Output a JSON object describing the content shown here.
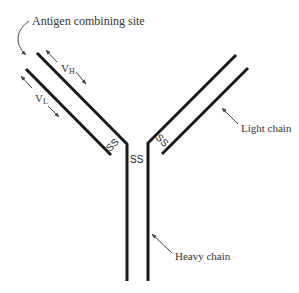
{
  "diagram": {
    "type": "antibody-structure",
    "colors": {
      "chain_stroke": "#1a1a1a",
      "annotation_stroke": "#444444",
      "text": "#333333",
      "background": "#ffffff"
    },
    "labels": {
      "antigen_site": "Antigen combining site",
      "vh_main": "V",
      "vh_sub": "H",
      "vl_main": "V",
      "vl_sub": "L",
      "light_chain": "Light chain",
      "heavy_chain": "Heavy chain",
      "ss_left": "SS",
      "ss_center": "SS",
      "ss_right": "SS"
    }
  }
}
